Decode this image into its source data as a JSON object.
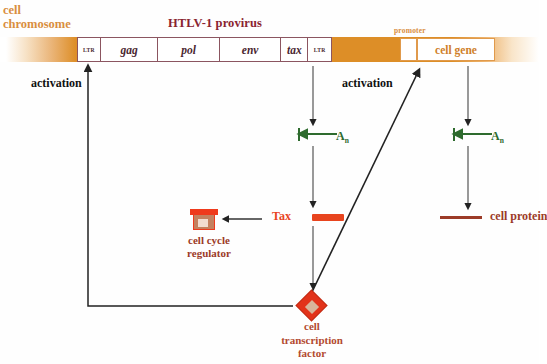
{
  "figure": {
    "chromosome_label": "cell\nchromosome",
    "chromosome_label_line1": "cell",
    "chromosome_label_line2": "chromosome",
    "provirus_title": "HTLV-1 provirus",
    "promoter_label": "promoter",
    "cell_gene_label": "cell gene",
    "activation_left": "activation",
    "activation_right": "activation"
  },
  "provirus_segments": [
    {
      "label": "LTR",
      "kind": "ltr"
    },
    {
      "label": "gag",
      "kind": "gene"
    },
    {
      "label": "pol",
      "kind": "gene"
    },
    {
      "label": "env",
      "kind": "gene"
    },
    {
      "label": "tax",
      "kind": "gene"
    },
    {
      "label": "LTR",
      "kind": "ltr"
    }
  ],
  "mrna": {
    "viral_polyA": "A",
    "viral_polyA_sub": "n",
    "cell_polyA": "A",
    "cell_polyA_sub": "n"
  },
  "products": {
    "tax_label": "Tax",
    "cell_protein_label": "cell protein",
    "cell_cycle_regulator_label": "cell cycle\nregulator",
    "cell_cycle_regulator_line1": "cell cycle",
    "cell_cycle_regulator_line2": "regulator",
    "cell_transcription_factor_line1": "cell",
    "cell_transcription_factor_line2": "transcription",
    "cell_transcription_factor_line3": "factor"
  },
  "colors": {
    "chromosome_orange": "#dd8e27",
    "provirus_outline": "#8b5560",
    "provirus_title": "#8a2430",
    "gene_text": "#4a2630",
    "promoter_orange": "#e09a4c",
    "cell_gene_text": "#cf7f2a",
    "mrna_green": "#2e6b2e",
    "tax_red": "#e8441e",
    "cell_protein_brown": "#9c3b28",
    "transcription_factor_red": "#e2331a",
    "arrow_black": "#222222"
  }
}
